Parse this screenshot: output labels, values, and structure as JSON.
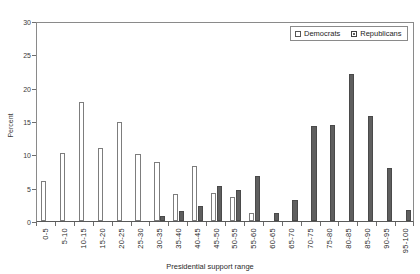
{
  "chart_data": {
    "type": "bar",
    "title": "",
    "xlabel": "Presidential support range",
    "ylabel": "Percent",
    "ylim": [
      0,
      30
    ],
    "yticks": [
      0,
      5,
      10,
      15,
      20,
      25,
      30
    ],
    "grid": false,
    "legend_position": "top-right",
    "categories": [
      "0-5",
      "5-10",
      "10-15",
      "15-20",
      "20-25",
      "25-30",
      "30-35",
      "35-40",
      "40-45",
      "45-50",
      "50-55",
      "55-60",
      "60-65",
      "65-70",
      "70-75",
      "75-80",
      "80-85",
      "85-90",
      "90-95",
      "95-100"
    ],
    "series": [
      {
        "name": "Democrats",
        "color": "#ffffff",
        "values": [
          6.0,
          10.2,
          17.9,
          11.0,
          14.8,
          10.1,
          8.8,
          4.0,
          8.3,
          4.2,
          3.6,
          1.2,
          0.0,
          0.0,
          0.0,
          0.0,
          0.0,
          0.0,
          0.0,
          0.0
        ]
      },
      {
        "name": "Republicans",
        "color": "#5f5f5f",
        "values": [
          0.0,
          0.0,
          0.0,
          0.0,
          0.0,
          0.0,
          0.8,
          1.5,
          2.2,
          5.2,
          4.6,
          6.8,
          1.2,
          3.1,
          14.2,
          14.4,
          22.0,
          15.8,
          7.9,
          1.7
        ]
      }
    ]
  },
  "legend": {
    "items": [
      {
        "label": "Democrats",
        "marker": "hollow-square-icon"
      },
      {
        "label": "Republicans",
        "marker": "filled-square-icon"
      }
    ]
  }
}
